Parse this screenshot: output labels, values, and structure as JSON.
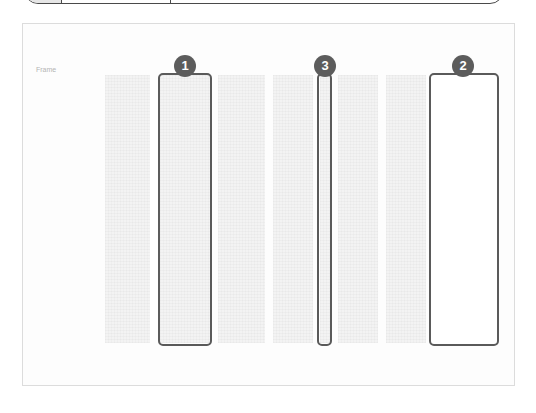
{
  "frame": {
    "label": "Frame"
  },
  "columns": [
    {
      "left": 105,
      "width": 45
    },
    {
      "left": 160,
      "width": 50
    },
    {
      "left": 218,
      "width": 47
    },
    {
      "left": 273,
      "width": 40
    },
    {
      "left": 320,
      "width": 10
    },
    {
      "left": 338,
      "width": 40
    },
    {
      "left": 386,
      "width": 40
    },
    {
      "left": 432,
      "width": 64
    }
  ],
  "selections": [
    {
      "number": "1",
      "left": 158,
      "width": 54
    },
    {
      "number": "3",
      "left": 317,
      "width": 15
    },
    {
      "number": "2",
      "left": 429,
      "width": 70
    }
  ],
  "colors": {
    "badge": "#5c5c5c",
    "selection_border": "#5a5a5a",
    "column_fill": "#f3f3f3",
    "frame_border": "#dcdcdc"
  }
}
